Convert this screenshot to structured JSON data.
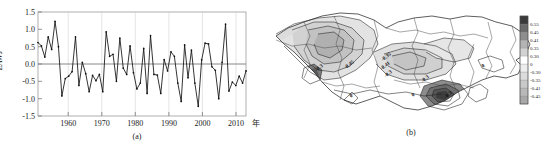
{
  "figure": {
    "panel_a_caption": "(a)",
    "panel_b_caption": "(b)",
    "x_unit_label": "年"
  },
  "chart_data": [
    {
      "type": "line",
      "title": "",
      "subtitle": "",
      "panel": "(a)",
      "xlabel": "年",
      "ylabel": "EAWJ",
      "xlim": [
        1951,
        2012
      ],
      "ylim": [
        -1.5,
        1.5
      ],
      "xticks": [
        1960,
        1970,
        1980,
        1990,
        2000,
        2010
      ],
      "yticks": [
        -1.5,
        -1.0,
        -0.5,
        0.0,
        0.5,
        1.0,
        1.5
      ],
      "xtick_labels": [
        "1960",
        "1970",
        "1980",
        "1990",
        "2000",
        "2010"
      ],
      "ytick_labels": [
        "-1.5",
        "-1.0",
        "-0.5",
        "0.0",
        "0.5",
        "1.0",
        "1.5"
      ],
      "grid": true,
      "zero_line": 0.0,
      "legend": [],
      "marker": "dot",
      "x": [
        1951,
        1952,
        1953,
        1954,
        1955,
        1956,
        1957,
        1958,
        1959,
        1960,
        1961,
        1962,
        1963,
        1964,
        1965,
        1966,
        1967,
        1968,
        1969,
        1970,
        1971,
        1972,
        1973,
        1974,
        1975,
        1976,
        1977,
        1978,
        1979,
        1980,
        1981,
        1982,
        1983,
        1984,
        1985,
        1986,
        1987,
        1988,
        1989,
        1990,
        1991,
        1992,
        1993,
        1994,
        1995,
        1996,
        1997,
        1998,
        1999,
        2000,
        2001,
        2002,
        2003,
        2004,
        2005,
        2006,
        2007,
        2008,
        2009,
        2010,
        2011,
        2012
      ],
      "values": [
        0.62,
        0.52,
        0.2,
        0.78,
        0.42,
        1.23,
        0.5,
        -0.92,
        -0.42,
        -0.35,
        -0.22,
        0.78,
        -0.62,
        0.05,
        -0.28,
        -0.8,
        -0.33,
        -0.48,
        -0.3,
        -0.8,
        0.93,
        0.22,
        0.28,
        -0.5,
        0.75,
        -0.12,
        -0.3,
        0.52,
        -0.25,
        -0.72,
        -0.55,
        0.45,
        -0.85,
        0.82,
        -0.3,
        -0.32,
        -0.85,
        0.13,
        -0.2,
        0.35,
        0.22,
        -0.55,
        -1.08,
        0.55,
        -0.4,
        0.4,
        -0.55,
        -1.22,
        0.12,
        0.6,
        0.58,
        -0.08,
        -0.18,
        -1.0,
        0.05,
        1.15,
        -0.78,
        -0.52,
        -0.62,
        -0.35,
        -0.55,
        -0.2
      ]
    },
    {
      "type": "heatmap",
      "panel": "(b)",
      "title": "",
      "map_kind": "contour-correlation-map",
      "colorbar": {
        "orientation": "vertical",
        "tick_labels": [
          "0.55",
          "0.45",
          "0.41",
          "0.35",
          "0.30",
          "0",
          "-0.30",
          "-0.35",
          "-0.41",
          "-0.45"
        ],
        "values": [
          0.55,
          0.45,
          0.41,
          0.35,
          0.3,
          0,
          -0.3,
          -0.35,
          -0.41,
          -0.45
        ],
        "colors": [
          "#3a3a3a",
          "#6a6a6a",
          "#8e8e8e",
          "#b3b3b3",
          "#d2d2d2",
          "#ffffff",
          "#ededed",
          "#dcdcdc",
          "#c9c9c9",
          "#b8b8b8",
          "#a8a8a8"
        ]
      },
      "contour_labels": [
        {
          "text": "-0.3",
          "x": 46,
          "y": 69
        },
        {
          "text": "-0.45",
          "x": 76,
          "y": 66
        },
        {
          "text": "-0.35",
          "x": 113,
          "y": 58
        },
        {
          "text": "-0.41",
          "x": 112,
          "y": 67
        },
        {
          "text": "-0.3",
          "x": 115,
          "y": 75
        },
        {
          "text": "-0.3",
          "x": 152,
          "y": 80
        },
        {
          "text": "0",
          "x": 140,
          "y": 96
        },
        {
          "text": "-0.3",
          "x": 175,
          "y": 96
        },
        {
          "text": "0",
          "x": 210,
          "y": 67
        },
        {
          "text": "0",
          "x": 78,
          "y": 97
        }
      ]
    }
  ]
}
